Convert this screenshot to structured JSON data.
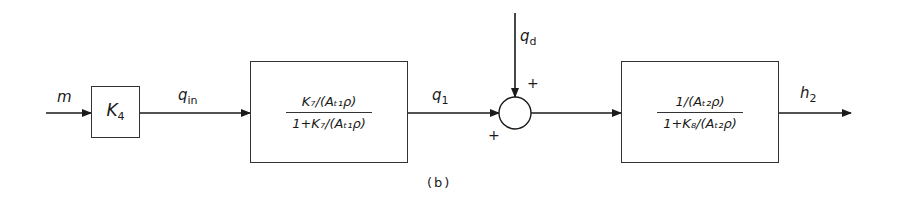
{
  "diagram": {
    "caption": "(b)",
    "input_signal": "m",
    "blocks": [
      {
        "id": "k4",
        "label": "K",
        "label_sub": "4"
      },
      {
        "id": "tank1",
        "numerator": "K₇/(Aₜ₁ρ)",
        "denominator": "1+K₇/(Aₜ₁ρ)"
      },
      {
        "id": "tank2",
        "numerator": "1/(Aₜ₂ρ)",
        "denominator": "1+K₈/(Aₜ₂ρ)"
      }
    ],
    "signals": {
      "q_in": {
        "base": "q",
        "sub": "in"
      },
      "q_1": {
        "base": "q",
        "sub": "1"
      },
      "q_d": {
        "base": "q",
        "sub": "d"
      },
      "h_2": {
        "base": "h",
        "sub": "2"
      }
    },
    "summing_junction": {
      "sign_left": "+",
      "sign_top": "+"
    }
  }
}
